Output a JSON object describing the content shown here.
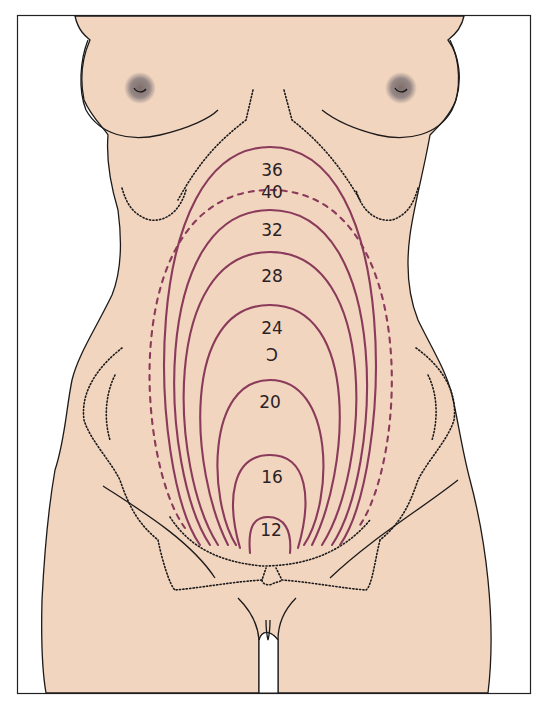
{
  "figure": {
    "colors": {
      "skin": "#f1d5bf",
      "outline": "#1c1a1b",
      "fundus_line": "#8a3a5a",
      "label": "#2a2226",
      "areola": "#8d7f7c",
      "frame": "#222222",
      "background": "#ffffff"
    },
    "fundal_levels": [
      {
        "week": "12",
        "style": "solid"
      },
      {
        "week": "16",
        "style": "solid"
      },
      {
        "week": "20",
        "style": "solid"
      },
      {
        "week": "24",
        "style": "solid"
      },
      {
        "week": "28",
        "style": "solid"
      },
      {
        "week": "32",
        "style": "solid"
      },
      {
        "week": "40",
        "style": "dashed"
      },
      {
        "week": "36",
        "style": "solid"
      }
    ],
    "umbilicus_symbol": "Ↄ"
  }
}
